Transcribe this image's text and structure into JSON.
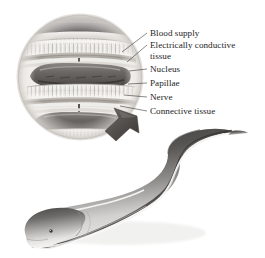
{
  "figure": {
    "inset": {
      "shape": "circle",
      "description": "Magnified cross-section of stacked electroplaque cells",
      "center": {
        "x": 80,
        "y": 77
      },
      "radius": 62
    },
    "arrow": {
      "name": "magnifier-arrow",
      "description": "Arrow pointing from the eel body up-left into the circular inset"
    },
    "labels": [
      {
        "id": "blood-supply",
        "text": "Blood supply",
        "x": 150,
        "y": 36,
        "leader_to": {
          "x": 122,
          "y": 52
        }
      },
      {
        "id": "electrically-conductive-tissue",
        "text": "Electrically conductive",
        "x": 150,
        "y": 48,
        "leader_to": {
          "x": 127,
          "y": 61
        }
      },
      {
        "id": "electrically-conductive-tissue-2",
        "text": "tissue",
        "x": 150,
        "y": 59,
        "leader_to": null
      },
      {
        "id": "nucleus",
        "text": "Nucleus",
        "x": 150,
        "y": 71,
        "leader_to": {
          "x": 129,
          "y": 71
        }
      },
      {
        "id": "papillae",
        "text": "Papillae",
        "x": 150,
        "y": 85,
        "leader_to": {
          "x": 128,
          "y": 84
        }
      },
      {
        "id": "nerve",
        "text": "Nerve",
        "x": 150,
        "y": 99,
        "leader_to": {
          "x": 124,
          "y": 96
        }
      },
      {
        "id": "connective-tissue",
        "text": "Connective tissue",
        "x": 150,
        "y": 113,
        "leader_to": {
          "x": 120,
          "y": 106
        }
      }
    ],
    "colors": {
      "text": "#242424",
      "leader_line": "#2b2b2b",
      "background": "#ffffff",
      "nucleus_band": "#6f6a67",
      "nucleus_band_dark": "#4a4643",
      "tissue_light": "#e4e1dd",
      "tissue_mid": "#c8c4bf",
      "papillae": "#f4f2ef",
      "circle_edge": "#b6b2ad",
      "eel_dark": "#4c4a49",
      "eel_mid": "#8d8b89",
      "eel_light": "#d6d4d2",
      "eel_highlight": "#f2f1ef",
      "arrow": "#56524f"
    }
  }
}
